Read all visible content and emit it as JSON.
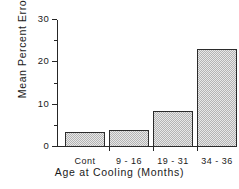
{
  "chart_data": {
    "type": "bar",
    "title": "",
    "xlabel": "Age at Cooling (Months)",
    "ylabel": "Mean Percent Errors",
    "categories": [
      "Cont",
      "9 - 16",
      "19 - 31",
      "34 - 36"
    ],
    "values": [
      3.5,
      4.0,
      8.5,
      23.2
    ],
    "ylim": [
      0,
      30
    ],
    "xlim_note": "categorical",
    "yticks_major": [
      0,
      10,
      20,
      30
    ],
    "yticks_major_labels": [
      "0",
      "10",
      "20",
      "30"
    ],
    "yticks_minor": [
      5,
      15,
      25
    ],
    "grid": false,
    "legend": false,
    "bar_fill": "#cfcfcf",
    "bar_edge": "#2b2b2b",
    "axis_color": "#262626",
    "background": "#ffffff"
  }
}
